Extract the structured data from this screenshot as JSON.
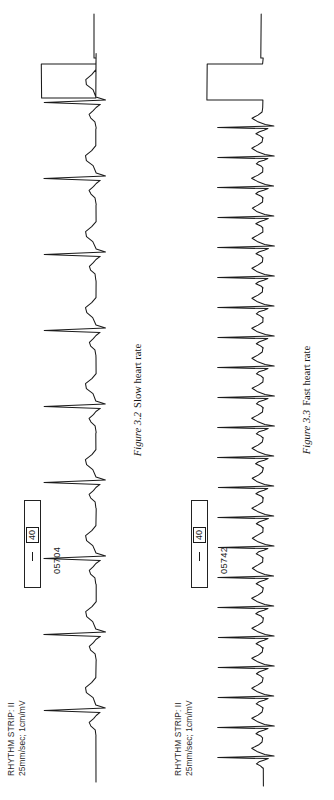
{
  "page": {
    "orientation": "rotated-90-ccw",
    "background_color": "#ffffff",
    "ink_color": "#1a1a1a"
  },
  "figures": [
    {
      "strip_header_line1": "RHYTHM STRIP: II",
      "strip_header_line2": "25mm/sec; 1cm/mV",
      "strip_header": "RHYTHM STRIP: II\n25mm/sec; 1cm/mV",
      "calibration_dash": "—",
      "calibration_value": "40",
      "strip_id": "05704",
      "caption_number": "Figure 3.2",
      "caption_text": "Slow heart rate"
    },
    {
      "strip_header_line1": "RHYTHM STRIP: II",
      "strip_header_line2": "25mm/sec; 1cm/mV",
      "strip_header": "RHYTHM STRIP: II\n25mm/sec; 1cm/mV",
      "calibration_dash": "—",
      "calibration_value": "40",
      "strip_id": "05742",
      "caption_number": "Figure 3.3",
      "caption_text": "Fast heart rate"
    }
  ],
  "chart_data": [
    {
      "type": "line",
      "title": "Figure 3.2 Slow heart rate",
      "subtitle": "RHYTHM STRIP: II  25mm/sec; 1cm/mV",
      "lead": "II",
      "paper_speed": "25mm/sec",
      "gain": "1cm/mV",
      "heart_rate_bpm": 50,
      "beat_count": 9,
      "rhythm": "slow (bradycardic) sinus rhythm",
      "strip_id": "05704",
      "xlabel": "time",
      "ylabel": "mV",
      "grid": false,
      "baseline_y": 0,
      "beat_x_positions": [
        64,
        140,
        216,
        292,
        368,
        444,
        520,
        596,
        672
      ],
      "qrs_amplitude": 1.0,
      "calibration_pulse": {
        "present": true,
        "position": "right-end",
        "amplitude": 1.0,
        "label": "40"
      },
      "series": [
        {
          "name": "Lead II",
          "beat_template": [
            {
              "t": 0,
              "v": 0
            },
            {
              "t": 10,
              "v": 0.02
            },
            {
              "t": 16,
              "v": 0.1
            },
            {
              "t": 22,
              "v": 0.13
            },
            {
              "t": 28,
              "v": 0.05
            },
            {
              "t": 33,
              "v": 0.0
            },
            {
              "t": 38,
              "v": -0.08
            },
            {
              "t": 41,
              "v": 1.0
            },
            {
              "t": 45,
              "v": -0.18
            },
            {
              "t": 50,
              "v": 0.0
            },
            {
              "t": 62,
              "v": 0.06
            },
            {
              "t": 70,
              "v": 0.18
            },
            {
              "t": 78,
              "v": 0.2
            },
            {
              "t": 86,
              "v": 0.08
            },
            {
              "t": 94,
              "v": 0.0
            },
            {
              "t": 120,
              "v": 0.0
            }
          ]
        }
      ]
    },
    {
      "type": "line",
      "title": "Figure 3.3 Fast heart rate",
      "subtitle": "RHYTHM STRIP: II  25mm/sec; 1cm/mV",
      "lead": "II",
      "paper_speed": "25mm/sec",
      "gain": "1cm/mV",
      "heart_rate_bpm": 136,
      "beat_count": 22,
      "rhythm": "fast (tachycardic) sinus rhythm",
      "strip_id": "05742",
      "xlabel": "time",
      "ylabel": "mV",
      "grid": false,
      "baseline_y": 0,
      "beat_x_positions": [
        32,
        62,
        92,
        122,
        152,
        182,
        212,
        242,
        272,
        302,
        332,
        362,
        392,
        422,
        452,
        482,
        512,
        542,
        572,
        602,
        632,
        662
      ],
      "qrs_amplitude": 0.9,
      "calibration_pulse": {
        "present": true,
        "position": "right-end",
        "amplitude": 1.0,
        "label": "40"
      },
      "series": [
        {
          "name": "Lead II",
          "beat_template": [
            {
              "t": 0,
              "v": 0
            },
            {
              "t": 4,
              "v": 0.05
            },
            {
              "t": 8,
              "v": 0.14
            },
            {
              "t": 12,
              "v": 0.08
            },
            {
              "t": 15,
              "v": -0.02
            },
            {
              "t": 18,
              "v": -0.1
            },
            {
              "t": 20,
              "v": 0.9
            },
            {
              "t": 23,
              "v": -0.22
            },
            {
              "t": 26,
              "v": -0.04
            },
            {
              "t": 32,
              "v": 0.12
            },
            {
              "t": 38,
              "v": 0.22
            },
            {
              "t": 44,
              "v": 0.1
            },
            {
              "t": 50,
              "v": 0.01
            },
            {
              "t": 58,
              "v": 0.0
            }
          ]
        }
      ]
    }
  ]
}
